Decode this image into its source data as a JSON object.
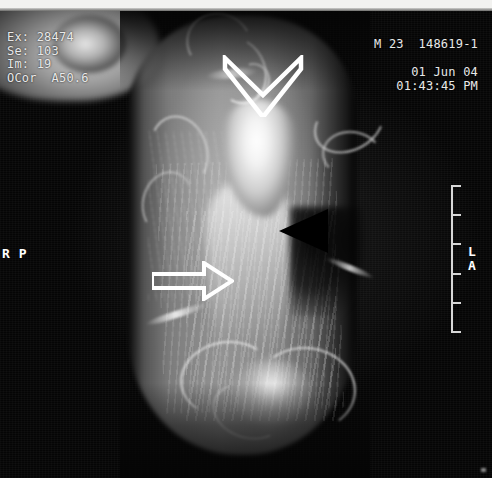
{
  "modality": {
    "study_id": "Ex: 28474",
    "series_id": "Se: 103",
    "image_number": "Im: 19",
    "plane": "OCor  A50.6"
  },
  "patient": {
    "sex_age": "M 23",
    "accession": "148619-1",
    "date": "01 Jun 04",
    "time": "01:43:45 PM"
  },
  "orientation": {
    "left_top": "R",
    "left_bottom": "P",
    "right_top": "L",
    "right_bottom": "A"
  },
  "scale_ruler": {
    "name": "scale-ruler",
    "tick_count": 6,
    "tick_positions_pct": [
      0,
      20,
      40,
      60,
      80,
      100
    ]
  },
  "annotations": [
    {
      "name": "open-chevron-marker",
      "shape": "open-chevron-down",
      "color": "#ffffff",
      "x": 222,
      "y": 44,
      "width": 82,
      "height": 62
    },
    {
      "name": "open-arrow-marker",
      "shape": "open-arrow-right",
      "color": "#ffffff",
      "x": 152,
      "y": 250,
      "width": 82,
      "height": 40
    },
    {
      "name": "solid-arrowhead-marker",
      "shape": "solid-arrowhead-left",
      "color": "#000000",
      "x": 278,
      "y": 198,
      "width": 52,
      "height": 44
    }
  ],
  "colors": {
    "background": "#000000",
    "overlay_text": "#e9e9e9",
    "ruler": "#d8d8d8",
    "marker_light": "#ffffff",
    "marker_dark": "#000000"
  },
  "image": {
    "description": "grayscale coronal MR image of a limb",
    "width": 492,
    "height": 478
  }
}
